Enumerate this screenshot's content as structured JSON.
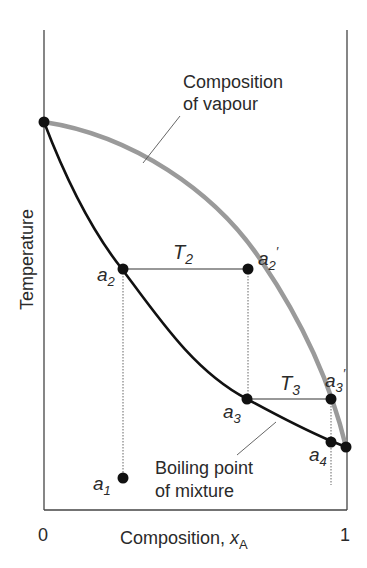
{
  "diagram": {
    "y_axis_label": "Temperature",
    "x_axis_label": "Composition, ",
    "x_axis_var": "x",
    "x_axis_sub": "A",
    "x_ticks": [
      "0",
      "1"
    ],
    "curves": {
      "vapour_label_line1": "Composition",
      "vapour_label_line2": "of vapour",
      "liquid_label_line1": "Boiling point",
      "liquid_label_line2": "of mixture"
    },
    "points": {
      "a1": {
        "base": "a",
        "sub": "1"
      },
      "a2": {
        "base": "a",
        "sub": "2"
      },
      "a2p": {
        "base": "a",
        "sub": "2",
        "prime": "′"
      },
      "a3": {
        "base": "a",
        "sub": "3"
      },
      "a3p": {
        "base": "a",
        "sub": "3",
        "prime": "′"
      },
      "a4": {
        "base": "a",
        "sub": "4"
      }
    },
    "tie_lines": {
      "T2": {
        "base": "T",
        "sub": "2"
      },
      "T3": {
        "base": "T",
        "sub": "3"
      }
    },
    "colors": {
      "liquid_curve": "#111111",
      "vapour_curve": "#9a9a9a",
      "axis": "#444444",
      "text": "#2a2a2a"
    }
  }
}
